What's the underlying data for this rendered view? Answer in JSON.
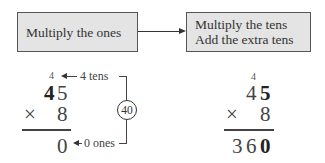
{
  "flow": {
    "step1": "Multiply the ones",
    "step2_line1": "Multiply the tens",
    "step2_line2": "Add the extra tens"
  },
  "left_calc": {
    "carry": "4",
    "multiplicand_tens": "4",
    "multiplicand_ones": "5",
    "operator": "×",
    "multiplier": "8",
    "result_ones": "0",
    "tens_label": "4 tens",
    "ones_label": "0 ones",
    "product_circle": "40"
  },
  "right_calc": {
    "carry": "4",
    "multiplicand_tens": "4",
    "multiplicand_ones": "5",
    "operator": "×",
    "multiplier": "8",
    "result_hundreds": "3",
    "result_tens": "6",
    "result_ones": "0"
  }
}
